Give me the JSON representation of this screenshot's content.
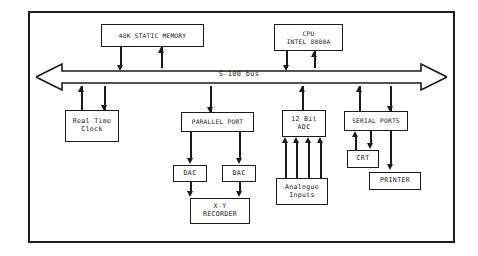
{
  "diagram": {
    "bus_label": "S-100 bus",
    "line_color": "#1a1a1a",
    "background": "#ffffff",
    "blocks": {
      "memory": {
        "line1": "48K STATIC MEMORY"
      },
      "cpu": {
        "line1": "CPU",
        "line2": "INTEL 8080A"
      },
      "real_time_clock": {
        "line1": "Real Time",
        "line2": "Clock"
      },
      "parallel_port": {
        "line1": "PARALLEL PORT"
      },
      "adc": {
        "line1": "12 Bit",
        "line2": "ADC"
      },
      "serial_ports": {
        "line1": "SERIAL PORTS"
      },
      "dac_left": {
        "line1": "DAC"
      },
      "dac_right": {
        "line1": "DAC"
      },
      "xy_recorder": {
        "line1": "X-Y",
        "line2": "RECORDER"
      },
      "analogue_inputs": {
        "line1": "Analogue",
        "line2": "Inputs"
      },
      "crt": {
        "line1": "CRT"
      },
      "printer": {
        "line1": "PRINTER"
      }
    }
  }
}
